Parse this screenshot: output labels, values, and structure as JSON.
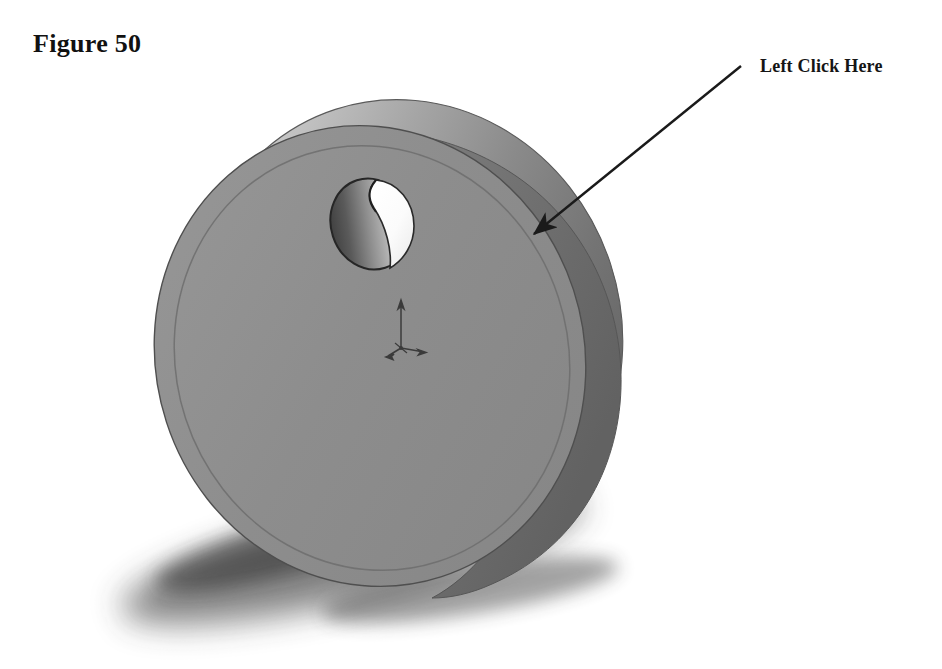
{
  "page": {
    "width": 942,
    "height": 669,
    "background": "#ffffff",
    "document_type": "tutorial-figure"
  },
  "figure": {
    "label": "Figure 50",
    "caption_position": "top-left"
  },
  "callout": {
    "label": "Left Click Here",
    "label_position": "top-right",
    "arrow": {
      "tail_x": 741,
      "tail_y": 66,
      "tip_x": 527,
      "tip_y": 240,
      "color": "#1a1a1a",
      "line_width": 2.4,
      "head_length": 26,
      "head_width": 15
    },
    "target": "disc-outer-rim-face"
  },
  "model": {
    "name": "extruded-disc-with-through-hole",
    "render_style": "shaded-solid",
    "colors": {
      "front_face": "#8c8c8c",
      "front_face_light": "#959595",
      "rim_highlight": "#c6c6c6",
      "rim_mid": "#9a9a9a",
      "rim_dark": "#6a6a6a",
      "rim_darkest": "#5e5e5e",
      "edge_line": "#4a4a4a",
      "hole_bore_dark": "#4f4f4f",
      "hole_bore_light": "#d8d8d8",
      "hole_opening": "#fdfdfd",
      "shadow": "#2e2e2e",
      "triad": "#3b3b3b"
    },
    "front_face": {
      "center_x": 370,
      "center_y": 356,
      "radius_x": 214,
      "radius_y": 232,
      "rotation_deg": -18
    },
    "back_face": {
      "center_x": 407,
      "center_y": 330,
      "radius_x": 214,
      "radius_y": 232,
      "rotation_deg": -18
    },
    "hole": {
      "center_x": 371,
      "center_y": 224,
      "radius_x": 40,
      "radius_y": 46,
      "rotation_deg": -18,
      "type": "through-hole"
    },
    "origin_triad": {
      "x": 401,
      "y": 348,
      "y_axis_length": 46,
      "x_axis_length": 24,
      "z_axis_length": 18,
      "label": "origin-triad"
    },
    "ground_shadow": {
      "center_x": 375,
      "center_y": 560,
      "radius_x": 250,
      "radius_y": 52,
      "rotation_deg": -14,
      "blur": 20
    }
  }
}
